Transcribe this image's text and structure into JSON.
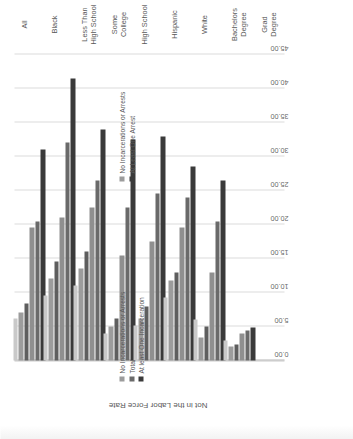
{
  "chart_data": {
    "type": "bar",
    "orientation": "horizontal",
    "title": "",
    "xlabel": "",
    "ylabel": "Not in the Labor Force Rate",
    "axis_title": "Not in the Labor Force Rate",
    "xlim": [
      0,
      45
    ],
    "grid": true,
    "tick_labels": [
      "45.00",
      "40.00",
      "35.00",
      "30.00",
      "25.00",
      "20.00",
      "15.00",
      "10.00",
      "5.00",
      "0.00"
    ],
    "tick_values": [
      45,
      40,
      35,
      30,
      25,
      20,
      15,
      10,
      5,
      0
    ],
    "categories": [
      "All",
      "Black",
      "Less Than High School",
      "Some College",
      "High School",
      "Hispanic",
      "White",
      "Bachelors Degree",
      "Grad Degree"
    ],
    "series": [
      {
        "name": "No Incarcerations or Arrests",
        "color": "#c9c9c9",
        "values": [
          6.2,
          9.5,
          11.0,
          4.0,
          5.2,
          9.2,
          6.0,
          3.0,
          0
        ]
      },
      {
        "name": "Total",
        "color": "#9c9c9c",
        "values": [
          7.0,
          12.0,
          13.5,
          5.0,
          6.2,
          11.8,
          3.4,
          2.0,
          0
        ]
      },
      {
        "name": "At Least One Arrest",
        "color": "#5e5e5e",
        "values": [
          8.4,
          14.5,
          16.0,
          6.2,
          8.0,
          13.0,
          5.0,
          2.4,
          0
        ]
      },
      {
        "name": "No Incarcerations or Arrests (2)",
        "color": "#8f8f8f",
        "values": [
          19.5,
          21.0,
          22.5,
          15.5,
          17.5,
          19.5,
          13.0,
          4.0,
          0
        ]
      },
      {
        "name": "Total (2)",
        "color": "#6a6a6a",
        "values": [
          20.5,
          32.0,
          26.5,
          22.5,
          24.5,
          24.0,
          20.5,
          4.4,
          0
        ]
      },
      {
        "name": "At Least One Arrest (2)",
        "color": "#3a3a3a",
        "values": [
          31.0,
          41.5,
          34.0,
          32.5,
          33.0,
          28.5,
          26.5,
          4.8,
          0
        ]
      }
    ],
    "legend_top": {
      "position": "right",
      "entries": [
        {
          "label": "No Incarcerations or Arrests",
          "color": "#9c9c9c"
        },
        {
          "label": "At Least One Arrest",
          "color": "#3a3a3a"
        }
      ]
    },
    "legend_bottom": {
      "position": "right",
      "entries": [
        {
          "label": "No Incarcerations or Arrests",
          "color": "#9c9c9c"
        },
        {
          "label": "Total",
          "color": "#6a6a6a"
        },
        {
          "label": "At least One Incarceration",
          "color": "#3a3a3a"
        }
      ]
    }
  }
}
